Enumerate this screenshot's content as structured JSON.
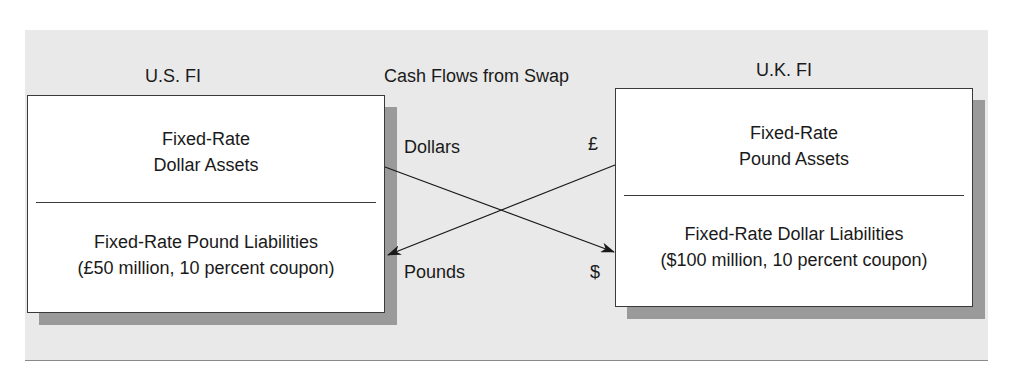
{
  "diagram": {
    "title": "Cash Flows from Swap",
    "colors": {
      "panel_background": "#e9e9e9",
      "box_background": "#ffffff",
      "box_border": "#3a3a3a",
      "shadow": "#9a9a9a",
      "line": "#1a1a1a"
    },
    "left_party": {
      "label": "U.S. FI",
      "assets": {
        "line1": "Fixed-Rate",
        "line2": "Dollar Assets"
      },
      "liabilities": {
        "line1": "Fixed-Rate Pound Liabilities",
        "line2": "(£50 million, 10 percent coupon)"
      }
    },
    "right_party": {
      "label": "U.K. FI",
      "assets": {
        "line1": "Fixed-Rate",
        "line2": "Pound Assets"
      },
      "liabilities": {
        "line1": "Fixed-Rate Dollar Liabilities",
        "line2": "($100 million, 10 percent coupon)"
      }
    },
    "flows": {
      "dollars_label": "Dollars",
      "pounds_label": "Pounds",
      "pound_symbol": "£",
      "dollar_symbol": "$"
    }
  }
}
